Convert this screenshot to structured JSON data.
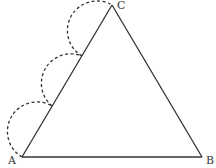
{
  "diagram": {
    "type": "geometry",
    "vertices": {
      "A": {
        "label": "A",
        "x": 22,
        "y": 157
      },
      "B": {
        "label": "B",
        "x": 202,
        "y": 157
      },
      "C": {
        "label": "C",
        "x": 112,
        "y": 5
      }
    },
    "segments": [
      {
        "from": "A",
        "to": "B",
        "style": "solid"
      },
      {
        "from": "B",
        "to": "C",
        "style": "solid"
      },
      {
        "from": "A",
        "to": "C",
        "style": "solid"
      }
    ],
    "arcs": {
      "count": 3,
      "style": "dashed",
      "on_side": "AC",
      "direction": "outward"
    },
    "colors": {
      "stroke": "#333333",
      "background": "#ffffff"
    }
  }
}
